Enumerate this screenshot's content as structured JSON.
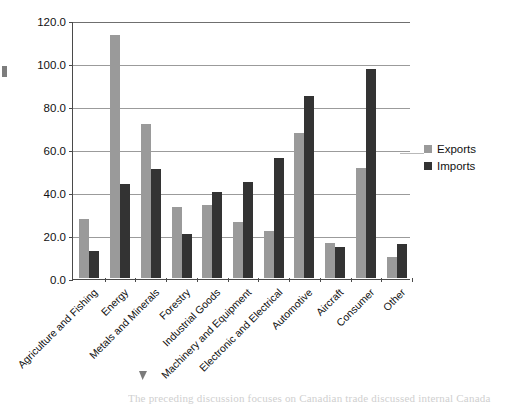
{
  "chart_data": {
    "type": "bar",
    "title": "",
    "xlabel": "",
    "ylabel": "",
    "ylim": [
      0,
      120
    ],
    "yticks": [
      "0.0",
      "20.0",
      "40.0",
      "60.0",
      "80.0",
      "100.0",
      "120.0"
    ],
    "ytick_values": [
      0,
      20,
      40,
      60,
      80,
      100,
      120
    ],
    "grid": true,
    "legend_position": "right",
    "categories": [
      "Agriculture and Fishing",
      "Energy",
      "Metals and Minerals",
      "Forestry",
      "Industrial Goods",
      "Machinery and Equipment",
      "Electronic and Electrical",
      "Automotive",
      "Aircraft",
      "Consumer",
      "Other"
    ],
    "series": [
      {
        "name": "Exports",
        "color": "#9a9a9a",
        "values": [
          27.5,
          113.0,
          71.5,
          33.0,
          34.0,
          26.0,
          22.0,
          67.5,
          16.5,
          51.0,
          10.0
        ]
      },
      {
        "name": "Imports",
        "color": "#333333",
        "values": [
          12.5,
          43.5,
          50.5,
          20.5,
          40.0,
          44.5,
          56.0,
          84.5,
          14.5,
          97.0,
          16.0
        ]
      }
    ]
  },
  "legend": {
    "items": [
      {
        "label": "Exports",
        "color": "#9a9a9a"
      },
      {
        "label": "Imports",
        "color": "#333333"
      }
    ]
  },
  "page": {
    "body_text": "The preceding discussion focuses on Canadian trade discussed internal Canada"
  }
}
